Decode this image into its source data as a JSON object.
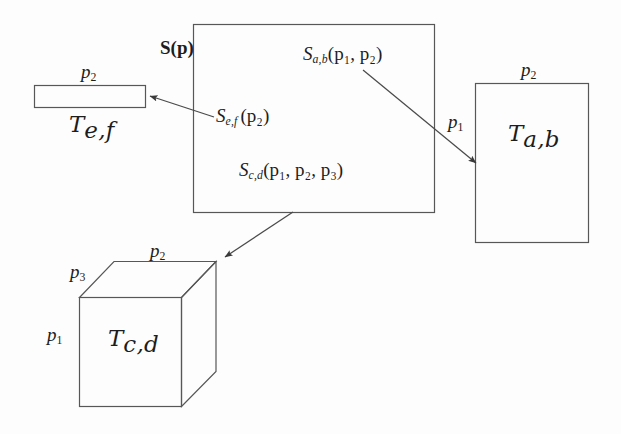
{
  "figure": {
    "type": "diagram",
    "background_color": "#fdfdfd",
    "line_color": "#4d4d4d",
    "text_color": "#1d1d1d"
  },
  "shapes": {
    "source_rect": {
      "name": "S(p)",
      "label": "S(p)",
      "x": 193,
      "y": 24,
      "w": 242,
      "h": 189
    },
    "tile_ef": {
      "name": "T_e,f",
      "label_T": "T",
      "label_sub": "e,f",
      "dim_top": "p",
      "dim_top_sub": "2",
      "x": 34,
      "y": 85,
      "w": 112,
      "h": 23
    },
    "tile_ab": {
      "name": "T_a,b",
      "label_T": "T",
      "label_sub": "a,b",
      "dim_top": "p",
      "dim_top_sub": "2",
      "dim_left": "p",
      "dim_left_sub": "1",
      "x": 475,
      "y": 83,
      "w": 114,
      "h": 160
    },
    "tile_cd": {
      "name": "T_c,d",
      "label_T": "T",
      "label_sub": "c,d",
      "dim_top": "p",
      "dim_top_sub": "2",
      "dim_depth": "p",
      "dim_depth_sub": "3",
      "dim_left": "p",
      "dim_left_sub": "1",
      "front_x": 79,
      "front_y": 297,
      "front_w": 103,
      "front_h": 110,
      "depth_dx": 34,
      "depth_dy": -36
    }
  },
  "mappings": [
    {
      "id": "s-ab",
      "label_S": "S",
      "label_sub": "a,b",
      "label_args": "(p1, p2)",
      "full": "S_{a,b}(p_1, p_2)",
      "arrow_from": [
        363,
        70
      ],
      "arrow_to": [
        477,
        164
      ],
      "target": "T_a,b"
    },
    {
      "id": "s-ef",
      "label_S": "S",
      "label_sub": "e,f",
      "label_args": "(p2)",
      "full": "S_{e,f}(p_2)",
      "arrow_from": [
        213,
        117
      ],
      "arrow_to": [
        149,
        96
      ],
      "target": "T_e,f"
    },
    {
      "id": "s-cd",
      "label_S": "S",
      "label_sub": "c,d",
      "label_args": "(p1, p2, p3)",
      "full": "S_{c,d}(p_1, p_2, p_3)",
      "arrow_from": [
        293,
        212
      ],
      "arrow_to": [
        224,
        258
      ],
      "target": "T_c,d"
    }
  ],
  "labels": {
    "source_name": "S(p)",
    "p1": "p",
    "p1_sub": "1",
    "p2": "p",
    "p2_sub": "2",
    "p3": "p",
    "p3_sub": "3",
    "S": "S",
    "T": "T",
    "sub_ab": "a,b",
    "sub_cd": "c,d",
    "sub_ef": "e,f",
    "args_ab": "(p₁, p₂)",
    "args_ef": "(p₂)",
    "args_cd": "(p₁, p₂, p₃)"
  }
}
